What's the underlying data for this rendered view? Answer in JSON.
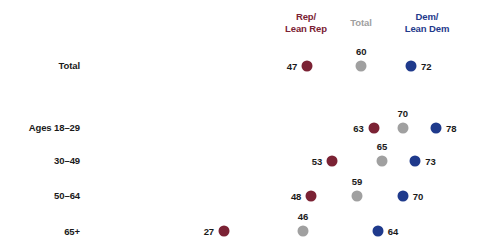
{
  "chart_data": {
    "type": "scatter",
    "title": "",
    "xlabel": "",
    "ylabel": "",
    "xlim": [
      20,
      82
    ],
    "grid": false,
    "legend_position": "top",
    "categories": [
      "Total",
      "Ages 18–29",
      "30–49",
      "50–64",
      "65+"
    ],
    "series": [
      {
        "name": "Rep/\nLean Rep",
        "color": "#7B2234",
        "values": [
          47,
          63,
          53,
          48,
          27
        ]
      },
      {
        "name": "Total",
        "color": "#A0A0A0",
        "values": [
          60,
          70,
          65,
          59,
          46
        ]
      },
      {
        "name": "Dem/\nLean Dem",
        "color": "#1F3A8C",
        "values": [
          72,
          78,
          73,
          70,
          64
        ]
      }
    ]
  },
  "header": {
    "rep_line1": "Rep/",
    "rep_line2": "Lean Rep",
    "total": "Total",
    "dem_line1": "Dem/",
    "dem_line2": "Lean Dem"
  },
  "rows": [
    {
      "label": "Total",
      "rep": "47",
      "total": "60",
      "dem": "72"
    },
    {
      "label": "Ages 18–29",
      "rep": "63",
      "total": "70",
      "dem": "78"
    },
    {
      "label": "30–49",
      "rep": "53",
      "total": "65",
      "dem": "73"
    },
    {
      "label": "50–64",
      "rep": "48",
      "total": "59",
      "dem": "70"
    },
    {
      "label": "65+",
      "rep": "27",
      "total": "46",
      "dem": "64"
    }
  ],
  "colors": {
    "rep": "#7B2234",
    "total": "#A0A0A0",
    "dem": "#1F3A8C",
    "text": "#1a1a1a",
    "background": "#ffffff"
  }
}
